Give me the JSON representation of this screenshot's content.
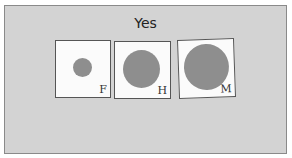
{
  "title": "Yes",
  "cards": [
    {
      "label": "F",
      "size": "small"
    },
    {
      "label": "H",
      "size": "medium"
    },
    {
      "label": "M",
      "size": "large"
    }
  ],
  "colors": {
    "background": "#d3d3d3",
    "card": "#fbfbfb",
    "circle": "#8e8e8e"
  }
}
